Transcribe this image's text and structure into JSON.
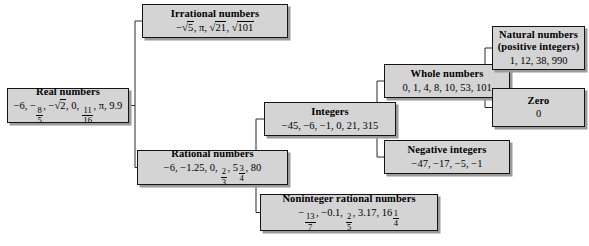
{
  "diagram": {
    "kind": "tree",
    "colors": {
      "box_fill": "#d4d4d4",
      "box_border": "#141414",
      "box_shadow": "#9a9a9a",
      "connector": "#2b2b2b",
      "text": "#000000",
      "background": "#ffffff"
    }
  },
  "nodes": {
    "real": {
      "title": "Real numbers",
      "items_text": "−6, − 8/5, −√2, 0, 11/16, π, 9.9",
      "items": [
        "−6",
        "− 8/5",
        "−√2",
        "0",
        "11/16",
        "π",
        "9.9"
      ]
    },
    "irrational": {
      "title": "Irrational numbers",
      "items_text": "−√5, π, √21, √101",
      "items": [
        "−√5",
        "π",
        "√21",
        "√101"
      ]
    },
    "rational": {
      "title": "Rational numbers",
      "items_text": "−6, −1.25, 0, 2/3, 5 3/4, 80",
      "items": [
        "−6",
        "−1.25",
        "0",
        "2/3",
        "5 3/4",
        "80"
      ]
    },
    "integers": {
      "title": "Integers",
      "items_text": "−45, −6, −1, 0, 21, 315",
      "items": [
        "−45",
        "−6",
        "−1",
        "0",
        "21",
        "315"
      ]
    },
    "noninteger": {
      "title": "Noninteger rational numbers",
      "items_text": "− 13/7, −0.1, 2/5, 3.17, 16 1/4",
      "items": [
        "− 13/7",
        "−0.1",
        "2/5",
        "3.17",
        "16 1/4"
      ]
    },
    "whole": {
      "title": "Whole numbers",
      "items_text": "0, 1, 4, 8, 10, 53, 101",
      "items": [
        "0",
        "1",
        "4",
        "8",
        "10",
        "53",
        "101"
      ]
    },
    "negative": {
      "title": "Negative integers",
      "items_text": "−47, −17, −5, −1",
      "items": [
        "−47",
        "−17",
        "−5",
        "−1"
      ]
    },
    "natural": {
      "title": "Natural numbers",
      "title_line2": "(positive integers)",
      "items_text": "1, 12, 38, 990",
      "items": [
        "1",
        "12",
        "38",
        "990"
      ]
    },
    "zero": {
      "title": "Zero",
      "items_text": "0",
      "items": [
        "0"
      ]
    }
  },
  "edges": [
    {
      "from": "real",
      "to": "irrational"
    },
    {
      "from": "real",
      "to": "rational"
    },
    {
      "from": "rational",
      "to": "integers"
    },
    {
      "from": "rational",
      "to": "noninteger"
    },
    {
      "from": "integers",
      "to": "whole"
    },
    {
      "from": "integers",
      "to": "negative"
    },
    {
      "from": "whole",
      "to": "natural"
    },
    {
      "from": "whole",
      "to": "zero"
    }
  ]
}
